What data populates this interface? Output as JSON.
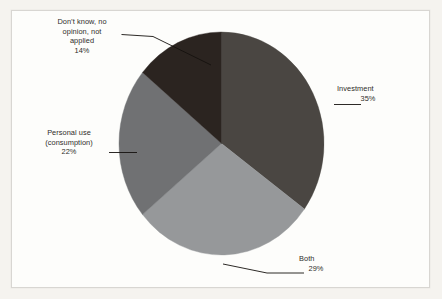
{
  "chart_data": {
    "type": "pie",
    "title": "",
    "subtitle": "",
    "xlabel": "",
    "ylabel": "",
    "legend_position": "none",
    "grid": false,
    "start_angle_deg": 0,
    "direction": "clockwise",
    "categories": [
      "Investment",
      "Both",
      "Personal use (consumption)",
      "Don't know, no opinion, not applied"
    ],
    "values": [
      35,
      29,
      22,
      14
    ],
    "value_unit": "%",
    "colors": [
      "#4a4642",
      "#96989a",
      "#707173",
      "#2b2420"
    ],
    "slices": [
      {
        "id": "investment",
        "label": "Investment",
        "value": 35,
        "value_text": "35%",
        "color": "#4a4642",
        "start_deg": 0,
        "end_deg": 126,
        "label_lines": [
          "Investment"
        ]
      },
      {
        "id": "both",
        "label": "Both",
        "value": 29,
        "value_text": "29%",
        "color": "#96989a",
        "start_deg": 126,
        "end_deg": 230.4,
        "label_lines": [
          "Both"
        ]
      },
      {
        "id": "personal-use",
        "label": "Personal use (consumption)",
        "value": 22,
        "value_text": "22%",
        "color": "#707173",
        "start_deg": 230.4,
        "end_deg": 309.6,
        "label_lines": [
          "Personal use",
          "(consumption)"
        ]
      },
      {
        "id": "dont-know",
        "label": "Don't know, no opinion, not applied",
        "value": 14,
        "value_text": "14%",
        "color": "#2b2420",
        "start_deg": 309.6,
        "end_deg": 360,
        "label_lines": [
          "Don’t know, no",
          "opinion, not",
          "applied"
        ]
      }
    ]
  },
  "labels": {
    "dontknow": {
      "line1": "Don’t know, no",
      "line2": "opinion, not",
      "line3": "applied",
      "value": "14%"
    },
    "investment": {
      "line1": "Investment",
      "value": "35%"
    },
    "personal": {
      "line1": "Personal use",
      "line2": "(consumption)",
      "value": "22%"
    },
    "both": {
      "line1": "Both",
      "value": "29%"
    }
  },
  "style": {
    "page_background": "#f5f3ef",
    "panel_background": "#fdfdfb",
    "panel_border": "#d8d6d2",
    "text_color": "#2e2c29",
    "leader_line_color": "#15120f"
  }
}
